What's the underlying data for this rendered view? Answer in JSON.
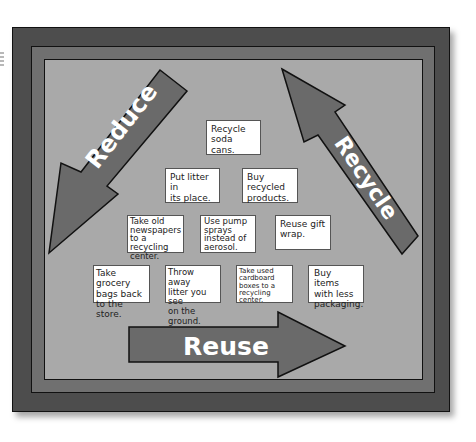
{
  "board": {
    "colors": {
      "outer_frame": "#4d4d4d",
      "middle_frame": "#707070",
      "board_background": "#a9a9a9",
      "arrow_fill": "#6a6a6a",
      "arrow_outline": "#111111",
      "arrow_text": "#ffffff",
      "card_background": "#ffffff"
    },
    "arrows": {
      "reduce": {
        "label": "Reduce",
        "direction": "down-left"
      },
      "recycle": {
        "label": "Recycle",
        "direction": "up-left"
      },
      "reuse": {
        "label": "Reuse",
        "direction": "right"
      }
    },
    "cards": [
      {
        "id": "recycle-soda-cans",
        "lines": [
          "Recycle",
          "soda cans."
        ]
      },
      {
        "id": "put-litter-in-place",
        "lines": [
          "Put litter in",
          "its place."
        ]
      },
      {
        "id": "buy-recycled-products",
        "lines": [
          "Buy recycled",
          "products."
        ]
      },
      {
        "id": "take-old-newspapers",
        "lines": [
          "Take old",
          "newspapers",
          "to a recycling",
          "center."
        ]
      },
      {
        "id": "use-pump-sprays",
        "lines": [
          "Use pump",
          "sprays",
          "instead of",
          "aerosol."
        ]
      },
      {
        "id": "reuse-gift-wrap",
        "lines": [
          "Reuse gift",
          "wrap."
        ]
      },
      {
        "id": "take-grocery-bags",
        "lines": [
          "Take grocery",
          "bags back",
          "to the store."
        ]
      },
      {
        "id": "throw-away-litter",
        "lines": [
          "Throw away",
          "litter you see",
          "on the ground."
        ]
      },
      {
        "id": "take-used-cardboard",
        "lines": [
          "Take used",
          "cardboard",
          "boxes to a",
          "recycling center."
        ]
      },
      {
        "id": "buy-less-packaging",
        "lines": [
          "Buy items",
          "with less",
          "packaging."
        ]
      }
    ]
  }
}
